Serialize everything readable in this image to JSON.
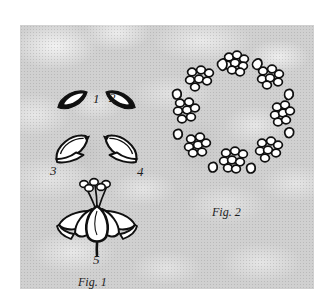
{
  "plate": {
    "background_color": "#d0d0d0",
    "ink_color": "#101010",
    "paper_color": "#ffffff"
  },
  "figure1": {
    "caption": "Fig. 1",
    "description": "floral parts dissection",
    "parts": [
      {
        "number": "1",
        "name": "outer-sepal-left"
      },
      {
        "number": "2",
        "name": "outer-sepal-right"
      },
      {
        "number": "3",
        "name": "inner-petal-left"
      },
      {
        "number": "4",
        "name": "inner-petal-right"
      },
      {
        "number": "5",
        "name": "whole-flower"
      }
    ]
  },
  "figure2": {
    "caption": "Fig. 2",
    "description": "ring arrangement of flower clusters"
  }
}
